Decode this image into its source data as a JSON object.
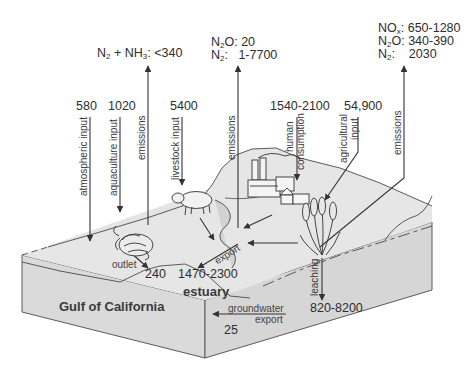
{
  "diagram": {
    "region_labels": {
      "sea": "Gulf of California",
      "estuary": "estuary"
    },
    "emission_blocks": {
      "aquaculture_emissions": {
        "prefix": "N",
        "sub1": "2",
        "mid": " + NH",
        "sub2": "3",
        "suffix": ": <340"
      },
      "livestock_emissions": {
        "row1_species": "N",
        "row1_sub": "2",
        "row1_tail": "O: 20",
        "row2_species": "N",
        "row2_sub": "2",
        "row2_tail": ":   1-7700"
      },
      "agriculture_emissions": {
        "row1_species": "NO",
        "row1_sub": "x",
        "row1_tail": ": 650-1280",
        "row2_species": "N",
        "row2_sub": "2",
        "row2_tail": "O: 340-390",
        "row3_species": "N",
        "row3_sub": "2",
        "row3_tail": ":    2030"
      }
    },
    "inputs": [
      {
        "value": "580",
        "label": "atmospheric input"
      },
      {
        "value": "1020",
        "label": "aquaculture input"
      },
      {
        "value": "5400",
        "label": "livestock input"
      },
      {
        "value": "1540-2100",
        "label_line1": "human",
        "label_line2": "consumption"
      },
      {
        "value": "54,900",
        "label_line1": "agricultural",
        "label_line2": "input"
      }
    ],
    "process_labels": {
      "emissions_1": "emissions",
      "emissions_2": "emissions",
      "emissions_3": "emissions",
      "outlet": "outlet",
      "export": "export",
      "leaching": "leaching",
      "groundwater_line1": "groundwater",
      "groundwater_line2": "export"
    },
    "flows": {
      "outlet_value": "240",
      "export_value": "1470-2300",
      "leaching_value": "820-8200",
      "groundwater_value": "25"
    },
    "icons": [
      "shrimp-icon",
      "pig-icon",
      "factory-icon",
      "house-icon",
      "wheat-icon"
    ],
    "colors": {
      "land": "#e2e2e2",
      "land_side": "#d8d8d8",
      "sea_side": "#dcdcdc",
      "line": "#3a3a3a",
      "text": "#2e2e2e"
    }
  }
}
